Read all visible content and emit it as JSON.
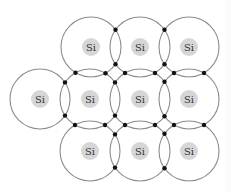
{
  "diagram": {
    "shell_radius": 30,
    "core_radius": 9,
    "electron_radius": 2.2,
    "colors": {
      "shell_stroke": "#8c8c8c",
      "core_fill": "#d6d6d6",
      "label_text": "#333333",
      "electron": "#111111",
      "background": "#ffffff"
    },
    "atoms": [
      {
        "id": "top-1",
        "label": "Si",
        "x": 91,
        "y": 47
      },
      {
        "id": "top-2",
        "label": "Si",
        "x": 140,
        "y": 47
      },
      {
        "id": "top-3",
        "label": "Si",
        "x": 189,
        "y": 47
      },
      {
        "id": "mid-0",
        "label": "Si",
        "x": 40,
        "y": 99
      },
      {
        "id": "mid-1",
        "label": "Si",
        "x": 90,
        "y": 99
      },
      {
        "id": "mid-2",
        "label": "Si",
        "x": 140,
        "y": 99
      },
      {
        "id": "mid-3",
        "label": "Si",
        "x": 189,
        "y": 99
      },
      {
        "id": "bot-1",
        "label": "Si",
        "x": 90,
        "y": 151
      },
      {
        "id": "bot-2",
        "label": "Si",
        "x": 140,
        "y": 151
      },
      {
        "id": "bot-3",
        "label": "Si",
        "x": 189,
        "y": 151
      }
    ],
    "bonds": [
      [
        "top-1",
        "top-2"
      ],
      [
        "top-2",
        "top-3"
      ],
      [
        "mid-0",
        "mid-1"
      ],
      [
        "mid-1",
        "mid-2"
      ],
      [
        "mid-2",
        "mid-3"
      ],
      [
        "bot-1",
        "bot-2"
      ],
      [
        "bot-2",
        "bot-3"
      ],
      [
        "top-1",
        "mid-1"
      ],
      [
        "top-2",
        "mid-2"
      ],
      [
        "top-3",
        "mid-3"
      ],
      [
        "mid-1",
        "bot-1"
      ],
      [
        "mid-2",
        "bot-2"
      ],
      [
        "mid-3",
        "bot-3"
      ]
    ]
  }
}
